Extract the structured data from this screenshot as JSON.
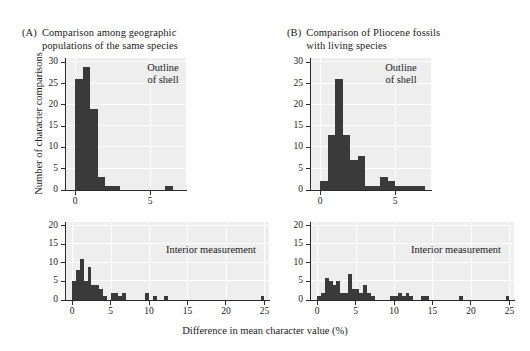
{
  "figure": {
    "xlabel": "Difference in mean character value (%)",
    "ylabel": "Number of character comparisons"
  },
  "panels": [
    {
      "tag": "(A)",
      "title": "Comparison among geographic\npopulations of the same species"
    },
    {
      "tag": "(B)",
      "title": "Comparison of Pliocene fossils\nwith living species"
    }
  ],
  "chart_data": [
    {
      "id": "A-outline",
      "type": "bar",
      "panel": "(A)",
      "title": "Outline\nof shell",
      "xlabel": "Difference in mean character value (%)",
      "ylabel": "Number of character comparisons",
      "xlim": [
        -0.6,
        7.4
      ],
      "ylim": [
        0,
        31
      ],
      "xticks": [
        0,
        5
      ],
      "yticks": [
        0,
        5,
        10,
        15,
        20,
        25,
        30
      ],
      "bin_width": 0.5,
      "grid": true,
      "bin_starts": [
        0.0,
        0.5,
        1.0,
        1.5,
        2.0,
        2.5,
        3.0,
        3.5,
        4.0,
        4.5,
        5.0,
        5.5,
        6.0,
        6.5
      ],
      "values": [
        26,
        29,
        19,
        3,
        1,
        1,
        0,
        0,
        0,
        0,
        0,
        0,
        1,
        0
      ]
    },
    {
      "id": "B-outline",
      "type": "bar",
      "panel": "(B)",
      "title": "Outline\nof shell",
      "xlabel": "Difference in mean character value (%)",
      "ylabel": "Number of character comparisons",
      "xlim": [
        -0.6,
        7.4
      ],
      "ylim": [
        0,
        31
      ],
      "xticks": [
        0,
        5
      ],
      "yticks": [
        0,
        5,
        10,
        15,
        20,
        25,
        30
      ],
      "bin_width": 0.5,
      "grid": true,
      "bin_starts": [
        0.0,
        0.5,
        1.0,
        1.5,
        2.0,
        2.5,
        3.0,
        3.5,
        4.0,
        4.5,
        5.0,
        5.5,
        6.0,
        6.5
      ],
      "values": [
        2,
        13,
        26,
        13,
        7,
        8,
        1,
        1,
        3,
        2,
        1,
        1,
        1,
        1
      ]
    },
    {
      "id": "A-interior",
      "type": "bar",
      "panel": "(A)",
      "title": "Interior measurement",
      "xlabel": "Difference in mean character value (%)",
      "ylabel": "Number of character comparisons",
      "xlim": [
        -0.8,
        25.6
      ],
      "ylim": [
        0,
        21
      ],
      "xticks": [
        0,
        5,
        10,
        15,
        20,
        25
      ],
      "yticks": [
        0,
        5,
        10,
        15,
        20
      ],
      "bin_width": 0.5,
      "grid": true,
      "bin_starts": [
        0.0,
        0.5,
        1.0,
        1.5,
        2.0,
        2.5,
        3.0,
        3.5,
        4.0,
        4.5,
        5.0,
        5.5,
        6.0,
        6.5,
        7.0,
        9.5,
        10.5,
        12.0,
        24.5
      ],
      "values": [
        5,
        8,
        11,
        5,
        9,
        4,
        4,
        3,
        1,
        0,
        2,
        2,
        1,
        2,
        0,
        2,
        1,
        1,
        1
      ]
    },
    {
      "id": "B-interior",
      "type": "bar",
      "panel": "(B)",
      "title": "Interior measurement",
      "xlabel": "Difference in mean character value (%)",
      "ylabel": "Number of character comparisons",
      "xlim": [
        -0.8,
        25.6
      ],
      "ylim": [
        0,
        21
      ],
      "xticks": [
        0,
        5,
        10,
        15,
        20,
        25
      ],
      "yticks": [
        0,
        5,
        10,
        15,
        20
      ],
      "bin_width": 0.5,
      "grid": true,
      "bin_starts": [
        0.0,
        0.5,
        1.0,
        1.5,
        2.0,
        2.5,
        3.0,
        3.5,
        4.0,
        4.5,
        5.0,
        5.5,
        6.0,
        6.5,
        7.0,
        7.5,
        9.5,
        10.0,
        10.5,
        11.0,
        11.5,
        12.0,
        13.5,
        14.0,
        18.5,
        24.5
      ],
      "values": [
        1,
        2,
        6,
        5,
        4,
        5,
        2,
        2,
        7,
        3,
        3,
        2,
        4,
        2,
        1,
        0,
        1,
        1,
        2,
        1,
        2,
        1,
        1,
        1,
        1,
        1
      ]
    }
  ]
}
